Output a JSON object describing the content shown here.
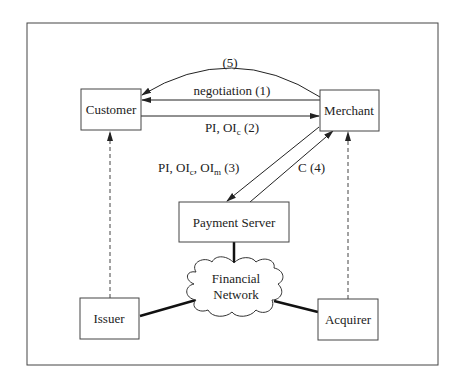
{
  "diagram": {
    "title": "",
    "nodes": {
      "customer": {
        "label": "Customer"
      },
      "merchant": {
        "label": "Merchant"
      },
      "payment_server": {
        "label": "Payment Server"
      },
      "financial_network": {
        "label_line1": "Financial",
        "label_line2": "Network"
      },
      "issuer": {
        "label": "Issuer"
      },
      "acquirer": {
        "label": "Acquirer"
      }
    },
    "edges": {
      "e5": {
        "label": "(5)",
        "from": "Merchant",
        "to": "Customer"
      },
      "e1": {
        "label": "negotiation (1)",
        "from": "Merchant",
        "to": "Customer"
      },
      "e2": {
        "label_main": "PI, OI",
        "label_sub": "c",
        "label_tail": " (2)",
        "from": "Customer",
        "to": "Merchant"
      },
      "e3": {
        "label_main": "PI, OI",
        "label_sub1": "c",
        "label_mid": ", OI",
        "label_sub2": "m",
        "label_tail": " (3)",
        "from": "Merchant",
        "to": "Payment Server"
      },
      "e4": {
        "label": "C (4)",
        "from": "Payment Server",
        "to": "Merchant"
      },
      "issuer_customer": {
        "style": "dashed",
        "from": "Issuer",
        "to": "Customer"
      },
      "acquirer_merchant": {
        "style": "dashed",
        "from": "Acquirer",
        "to": "Merchant"
      },
      "issuer_network": {
        "style": "thick"
      },
      "acquirer_network": {
        "style": "thick"
      },
      "server_network": {
        "style": "thick"
      }
    },
    "colors": {
      "line": "#222222",
      "frame": "#444444",
      "background": "#ffffff"
    }
  }
}
